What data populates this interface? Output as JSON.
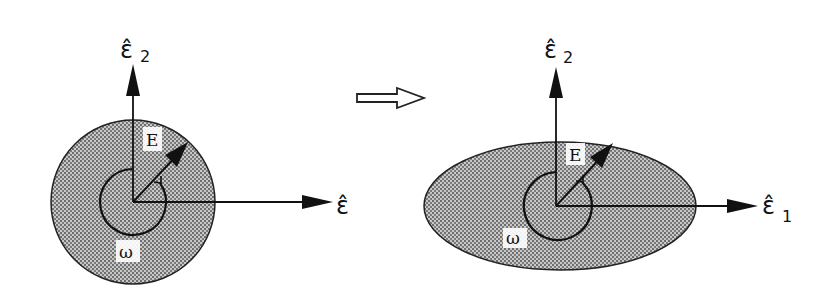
{
  "figure": {
    "left_panel": {
      "shape": "circle",
      "axis_vertical_label": "ε̂",
      "axis_vertical_subscript": "2",
      "axis_horizontal_label": "ε̂",
      "axis_horizontal_subscript": "1",
      "vector_label": "E",
      "rotation_label": "ω"
    },
    "transition_arrow": "hollow-right-arrow",
    "right_panel": {
      "shape": "ellipse",
      "axis_vertical_label": "ε̂",
      "axis_vertical_subscript": "2",
      "axis_horizontal_label": "ε̂",
      "axis_horizontal_subscript": "1",
      "vector_label": "E",
      "rotation_label": "ω"
    },
    "colors": {
      "ink": "#111111",
      "fill_stipple": "#9a9a9a",
      "background": "#ffffff"
    }
  }
}
